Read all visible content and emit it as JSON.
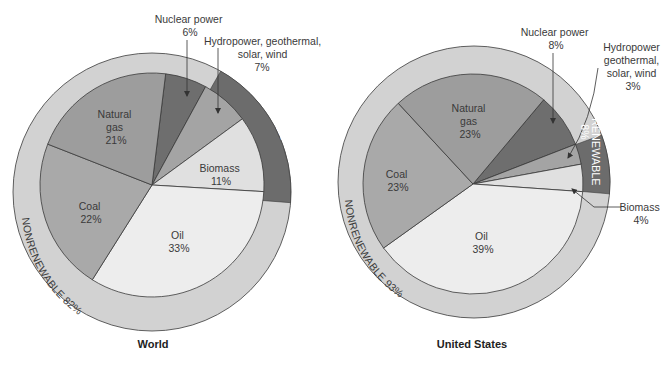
{
  "chart_data": [
    {
      "type": "pie",
      "title": "World",
      "start_angle_deg": 7,
      "slices": [
        {
          "key": "nuclear",
          "label": "Nuclear power",
          "value": 6,
          "color": "#6e6e6e"
        },
        {
          "key": "hydro",
          "label": "Hydropower, geothermal, solar, wind",
          "value": 7,
          "color": "#a4a4a4"
        },
        {
          "key": "biomass",
          "label": "Biomass",
          "value": 11,
          "color": "#e0e0e0"
        },
        {
          "key": "oil",
          "label": "Oil",
          "value": 33,
          "color": "#ededed"
        },
        {
          "key": "coal",
          "label": "Coal",
          "value": 22,
          "color": "#a9a9a9"
        },
        {
          "key": "gas",
          "label": "Natural gas",
          "value": 21,
          "color": "#9d9d9d"
        }
      ],
      "ring": [
        {
          "label": "NONRENEWABLE 82%",
          "value": 82,
          "color": "#d2d2d2"
        },
        {
          "label": "RENEWABLE 18%",
          "value": 18,
          "color": "#6c6c6c"
        }
      ]
    },
    {
      "type": "pie",
      "title": "United States",
      "start_angle_deg": 40,
      "slices": [
        {
          "key": "nuclear",
          "label": "Nuclear power",
          "value": 8,
          "color": "#6e6e6e"
        },
        {
          "key": "hydro",
          "label": "Hydropower geothermal, solar, wind",
          "value": 3,
          "color": "#a4a4a4"
        },
        {
          "key": "biomass",
          "label": "Biomass",
          "value": 4,
          "color": "#e0e0e0"
        },
        {
          "key": "oil",
          "label": "Oil",
          "value": 39,
          "color": "#ededed"
        },
        {
          "key": "coal",
          "label": "Coal",
          "value": 23,
          "color": "#a9a9a9"
        },
        {
          "key": "gas",
          "label": "Natural gas",
          "value": 23,
          "color": "#9d9d9d"
        }
      ],
      "ring": [
        {
          "label": "NONRENEWABLE 93%",
          "value": 93,
          "color": "#d2d2d2"
        },
        {
          "label": "RENEWABLE 8%",
          "value": 8,
          "color": "#6c6c6c"
        }
      ]
    }
  ],
  "world": {
    "title": "World",
    "nuclear": {
      "name": "Nuclear power",
      "pct": "6%"
    },
    "hydro": {
      "line1": "Hydropower, geothermal,",
      "line2": "solar, wind",
      "pct": "7%"
    },
    "gas": {
      "line1": "Natural",
      "line2": "gas",
      "pct": "21%"
    },
    "biomass": {
      "name": "Biomass",
      "pct": "11%"
    },
    "coal": {
      "name": "Coal",
      "pct": "22%"
    },
    "oil": {
      "name": "Oil",
      "pct": "33%"
    },
    "renewable": "RENEWABLE 18%",
    "nonrenewable": "NONRENEWABLE 82%"
  },
  "us": {
    "title": "United States",
    "nuclear": {
      "name": "Nuclear power",
      "pct": "8%"
    },
    "hydro": {
      "line1": "Hydropower",
      "line2": "geothermal,",
      "line3": "solar, wind",
      "pct": "3%"
    },
    "gas": {
      "line1": "Natural",
      "line2": "gas",
      "pct": "23%"
    },
    "biomass": {
      "name": "Biomass",
      "pct": "4%"
    },
    "coal": {
      "name": "Coal",
      "pct": "23%"
    },
    "oil": {
      "name": "Oil",
      "pct": "39%"
    },
    "renewable_1": "RENEWABLE",
    "renewable_2": "8%",
    "nonrenewable": "NONRENEWABLE 93%"
  },
  "colors": {
    "stroke": "#3a3a3a",
    "ring_light": "#d2d2d2",
    "ring_dark": "#6c6c6c",
    "ring_text_light": "#ffffff",
    "ring_text_dark": "#3a3a3a"
  }
}
